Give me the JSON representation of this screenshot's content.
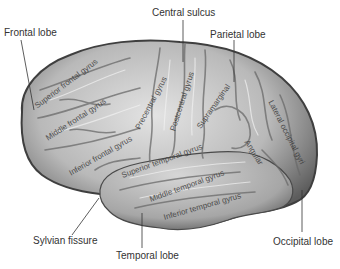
{
  "diagram": {
    "lobe_labels": {
      "frontal": "Frontal lobe",
      "central_sulcus": "Central sulcus",
      "parietal": "Parietal lobe",
      "sylvian": "Sylvian fissure",
      "temporal": "Temporal lobe",
      "occipital": "Occipital lobe"
    },
    "gyrus_labels": {
      "superior_frontal": "Superior frontal gyrus",
      "middle_frontal": "Middle frontal gyrus",
      "inferior_frontal": "Inferior frontal gyrus",
      "precentral": "Precentral gyrus",
      "postcentral": "Postcentral gyrus",
      "supramarginal": "Supramarginal",
      "angular": "Angular",
      "lateral_occipital": "Lateral occipital gyri",
      "superior_temporal": "Superior temporal gyrus",
      "middle_temporal": "Middle temporal gyrus",
      "inferior_temporal": "Inferior temporal gyrus"
    },
    "colors": {
      "background": "#ffffff",
      "brain_light": "#d9d9d9",
      "brain_mid": "#a8a8a8",
      "brain_dark": "#4a4a4a",
      "leader_line": "#333333",
      "label_text": "#333333"
    }
  }
}
